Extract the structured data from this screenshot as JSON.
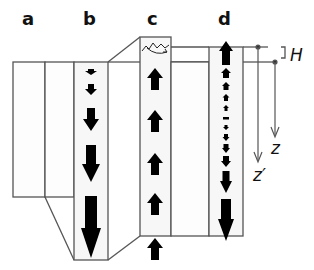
{
  "panels": [
    {
      "id": "a",
      "label": "a"
    },
    {
      "id": "b",
      "label": "b"
    },
    {
      "id": "c",
      "label": "c"
    },
    {
      "id": "d",
      "label": "d"
    }
  ],
  "annotations": {
    "H": "H",
    "z": "z",
    "z_prime": "z′"
  },
  "arrows": {
    "b": {
      "direction": "down",
      "count": 5,
      "sizes": [
        "tiny",
        "small",
        "medium",
        "large",
        "xlarge"
      ]
    },
    "c": {
      "direction": "up",
      "count": 5,
      "sizes": [
        "medium",
        "medium",
        "medium",
        "medium",
        "medium"
      ]
    },
    "d": {
      "direction": "up-then-down",
      "count": 15
    }
  },
  "colors": {
    "line": "#555555",
    "arrow": "#000000",
    "column_fill": "#f7f7f7",
    "background": "#ffffff"
  }
}
